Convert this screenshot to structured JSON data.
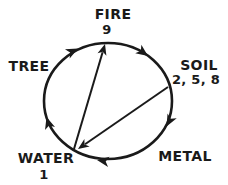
{
  "figure": {
    "type": "five-element-cycle-diagram",
    "background_color": "#ffffff",
    "line_color": "#1a1a1a",
    "text_color": "#1a1a1a",
    "nodes": [
      {
        "id": "fire",
        "label": "FIRE",
        "numbers": "9"
      },
      {
        "id": "soil",
        "label": "SOIL",
        "numbers": "2, 5, 8"
      },
      {
        "id": "metal",
        "label": "METAL"
      },
      {
        "id": "water",
        "label": "WATER",
        "numbers": "1"
      },
      {
        "id": "tree",
        "label": "TREE"
      }
    ],
    "cycle_edges": [
      {
        "from": "tree",
        "to": "fire"
      },
      {
        "from": "fire",
        "to": "soil"
      },
      {
        "from": "soil",
        "to": "metal"
      },
      {
        "from": "metal",
        "to": "water"
      },
      {
        "from": "water",
        "to": "tree"
      }
    ],
    "cross_edges": [
      {
        "from": "water",
        "to": "fire"
      },
      {
        "from": "soil",
        "to": "water"
      }
    ]
  }
}
